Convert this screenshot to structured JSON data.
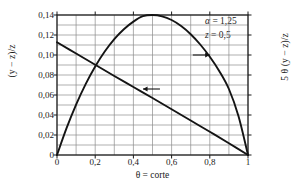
{
  "chart_data": {
    "type": "line",
    "title": "",
    "xlabel": "θ = corte",
    "ylabel_left": "(y − z)/z",
    "ylabel_right": "5 θ (y − z)/z",
    "xlim": [
      0,
      1
    ],
    "ylim": [
      0,
      0.14
    ],
    "grid": true,
    "legend": "none",
    "x_ticks": [
      "0",
      "0,2",
      "0,4",
      "0,6",
      "0,8",
      "1"
    ],
    "x_tick_values": [
      0,
      0.2,
      0.4,
      0.6,
      0.8,
      1
    ],
    "x_minor_step": 0.1,
    "y_ticks": [
      "0",
      "0,02",
      "0,04",
      "0,06",
      "0,08",
      "0,10",
      "0,12",
      "0,14"
    ],
    "y_tick_values": [
      0,
      0.02,
      0.04,
      0.06,
      0.08,
      0.1,
      0.12,
      0.14
    ],
    "y_minor_step": 0.01,
    "annotations": [
      {
        "text_symbol": "α",
        "text_rest": " = 1,25"
      },
      {
        "text_symbol": "z",
        "text_rest": " = 0,5"
      }
    ],
    "series": [
      {
        "name": "5 θ (y − z)/z",
        "axis": "right",
        "arrow": "right",
        "arrow_at": {
          "x": 0.8,
          "y": 0.1
        },
        "x": [
          0.0,
          0.05,
          0.1,
          0.15,
          0.2,
          0.25,
          0.3,
          0.35,
          0.4,
          0.45,
          0.5,
          0.55,
          0.6,
          0.65,
          0.7,
          0.75,
          0.8,
          0.85,
          0.9,
          0.95,
          1.0
        ],
        "values": [
          0.0,
          0.0268,
          0.0504,
          0.0709,
          0.0886,
          0.1035,
          0.1159,
          0.1258,
          0.1334,
          0.1388,
          0.14,
          0.1387,
          0.135,
          0.129,
          0.1208,
          0.1105,
          0.0982,
          0.0838,
          0.066,
          0.039,
          0.0
        ]
      },
      {
        "name": "(y − z)/z",
        "axis": "left",
        "arrow": "left",
        "arrow_at": {
          "x": 0.45,
          "y": 0.066
        },
        "x": [
          0.0,
          0.1,
          0.2,
          0.3,
          0.4,
          0.5,
          0.6,
          0.7,
          0.8,
          0.9,
          1.0
        ],
        "values": [
          0.1128,
          0.1015,
          0.0902,
          0.079,
          0.068,
          0.057,
          0.0458,
          0.0345,
          0.0232,
          0.0118,
          0.0
        ]
      }
    ]
  },
  "plot_geometry": {
    "left": 57,
    "right": 248,
    "top": 15,
    "bottom": 155
  }
}
